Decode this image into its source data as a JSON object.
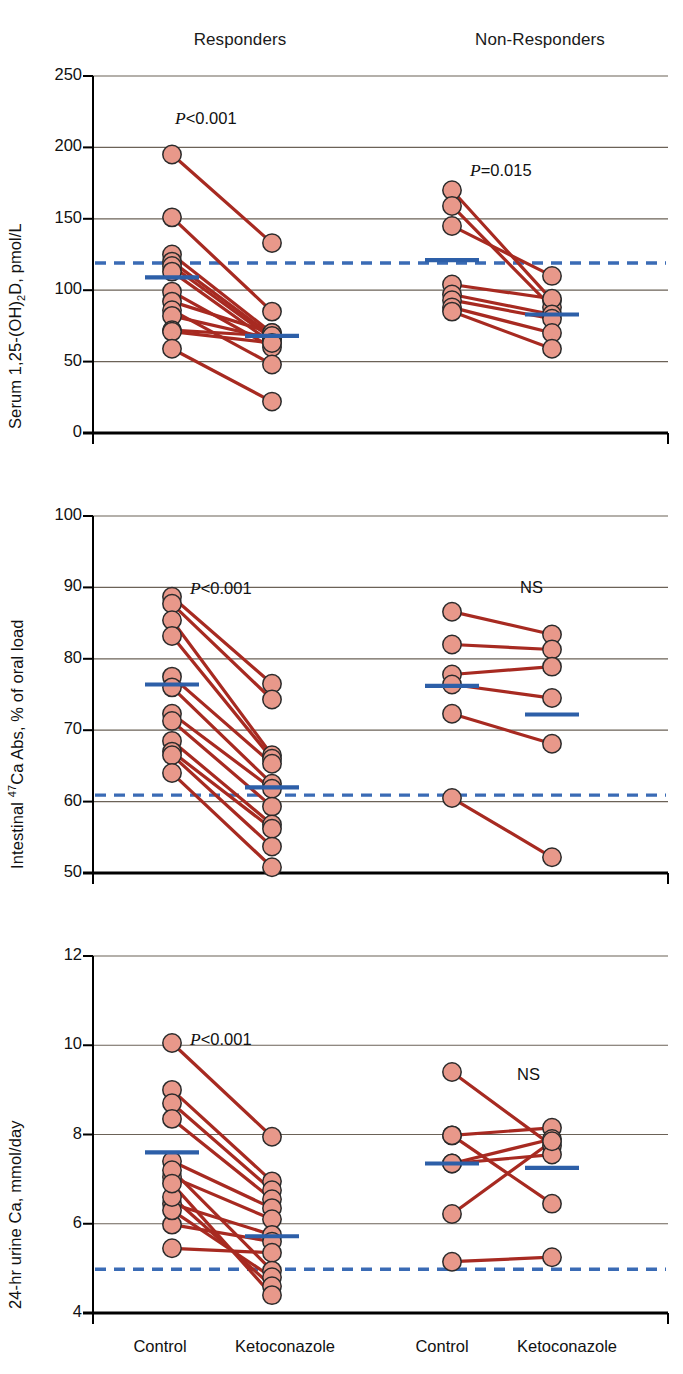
{
  "figure": {
    "groups": [
      {
        "key": "responders",
        "label": "Responders"
      },
      {
        "key": "nonresponders",
        "label": "Non-Responders"
      }
    ],
    "x_categories": [
      "Control",
      "Ketoconazole"
    ],
    "colors": {
      "marker_fill": "#E8988A",
      "marker_stroke": "#2b2b2b",
      "line": "#A72A21",
      "mean_bar": "#2D5FA8",
      "reference_dashed": "#3A6BB5",
      "axis": "#000000",
      "gridline": "#6b6257",
      "text": "#111111"
    }
  },
  "chart_data": [
    {
      "type": "line",
      "panel": 1,
      "title": "",
      "ylabel": "Serum 1,25-(OH)2D, pmol/L",
      "ylabel_parts": {
        "pre": "Serum 1,25-(OH)",
        "sub": "2",
        "post": "D, pmol/L"
      },
      "xlabel": "",
      "ylim": [
        0,
        250
      ],
      "yticks": [
        0,
        50,
        100,
        150,
        200,
        250
      ],
      "ytick_labels": [
        "0",
        "50",
        "100",
        "150",
        "200",
        "250"
      ],
      "grid": true,
      "groups": [
        {
          "name": "Responders",
          "annotation": "P<0.001",
          "annotation_html": "<i>P</i><0.001",
          "x": [
            "Control",
            "Ketoconazole"
          ],
          "pairs": [
            [
              195,
              133
            ],
            [
              151,
              85
            ],
            [
              125,
              70
            ],
            [
              120,
              68
            ],
            [
              117,
              66
            ],
            [
              113,
              63
            ],
            [
              99,
              60
            ],
            [
              92,
              70
            ],
            [
              86,
              48
            ],
            [
              82,
              66
            ],
            [
              72,
              68
            ],
            [
              71,
              63
            ],
            [
              59,
              22
            ]
          ],
          "mean_control": 109,
          "mean_treated": 68
        },
        {
          "name": "Non-Responders",
          "annotation": "P=0.015",
          "annotation_html": "<i>P</i>=0.015",
          "x": [
            "Control",
            "Ketoconazole"
          ],
          "pairs": [
            [
              170,
              93
            ],
            [
              159,
              88
            ],
            [
              145,
              110
            ],
            [
              104,
              94
            ],
            [
              97,
              83
            ],
            [
              93,
              80
            ],
            [
              88,
              70
            ],
            [
              85,
              59
            ]
          ],
          "mean_control": 121,
          "mean_treated": 83
        }
      ],
      "reference_line": {
        "value": 119,
        "style": "dashed",
        "spans": "full-width"
      }
    },
    {
      "type": "line",
      "panel": 2,
      "title": "",
      "ylabel": "Intestinal 47Ca Abs, % of oral load",
      "ylabel_parts": {
        "pre": "Intestinal ",
        "sup": "47",
        "post": "Ca Abs, % of oral load"
      },
      "xlabel": "",
      "ylim": [
        50,
        100
      ],
      "yticks": [
        50,
        60,
        70,
        80,
        90,
        100
      ],
      "ytick_labels": [
        "50",
        "60",
        "70",
        "80",
        "90",
        "100"
      ],
      "grid": true,
      "groups": [
        {
          "name": "Responders",
          "annotation": "P<0.001",
          "annotation_html": "<i>P</i><0.001",
          "x": [
            "Control",
            "Ketoconazole"
          ],
          "pairs": [
            [
              88.7,
              76.5
            ],
            [
              87.7,
              74.3
            ],
            [
              85.4,
              66.5
            ],
            [
              83.2,
              66.0
            ],
            [
              77.5,
              65.3
            ],
            [
              76.0,
              62.5
            ],
            [
              72.3,
              61.8
            ],
            [
              71.3,
              59.3
            ],
            [
              68.5,
              56.8
            ],
            [
              67.0,
              56.2
            ],
            [
              66.5,
              53.7
            ],
            [
              64.0,
              50.8
            ]
          ],
          "mean_control": 76.4,
          "mean_treated": 62.0
        },
        {
          "name": "Non-Responders",
          "annotation": "NS",
          "annotation_html": "NS",
          "x": [
            "Control",
            "Ketoconazole"
          ],
          "pairs": [
            [
              86.6,
              83.4
            ],
            [
              82.0,
              81.3
            ],
            [
              77.8,
              78.9
            ],
            [
              76.4,
              74.5
            ],
            [
              72.3,
              68.1
            ],
            [
              60.5,
              52.2
            ]
          ],
          "mean_control": 76.2,
          "mean_treated": 72.2
        }
      ],
      "reference_line": {
        "value": 60.9,
        "style": "dashed",
        "spans": "full-width"
      }
    },
    {
      "type": "line",
      "panel": 3,
      "title": "",
      "ylabel": "24-hr urine Ca, mmol/day",
      "ylabel_parts": {
        "pre": "24-hr urine Ca, mmol/day"
      },
      "xlabel": "",
      "ylim": [
        4,
        12
      ],
      "yticks": [
        4,
        6,
        8,
        10,
        12
      ],
      "ytick_labels": [
        "4",
        "6",
        "8",
        "10",
        "12"
      ],
      "grid": true,
      "groups": [
        {
          "name": "Responders",
          "annotation": "P<0.001",
          "annotation_html": "<i>P</i><0.001",
          "x": [
            "Control",
            "Ketoconazole"
          ],
          "pairs": [
            [
              10.05,
              7.95
            ],
            [
              9.0,
              6.95
            ],
            [
              8.7,
              6.75
            ],
            [
              8.35,
              6.55
            ],
            [
              7.4,
              6.35
            ],
            [
              7.05,
              6.1
            ],
            [
              6.45,
              5.75
            ],
            [
              5.98,
              5.6
            ],
            [
              5.45,
              5.35
            ],
            [
              7.2,
              4.95
            ],
            [
              6.3,
              4.8
            ],
            [
              6.6,
              4.6
            ],
            [
              6.9,
              4.4
            ]
          ],
          "mean_control": 7.6,
          "mean_treated": 5.72
        },
        {
          "name": "Non-Responders",
          "annotation": "NS",
          "annotation_html": "NS",
          "x": [
            "Control",
            "Ketoconazole"
          ],
          "pairs": [
            [
              9.4,
              7.75
            ],
            [
              7.98,
              8.15
            ],
            [
              7.98,
              6.45
            ],
            [
              7.35,
              7.9
            ],
            [
              7.35,
              7.55
            ],
            [
              6.22,
              7.85
            ],
            [
              5.15,
              5.25
            ]
          ],
          "mean_control": 7.35,
          "mean_treated": 7.25
        }
      ],
      "reference_line": {
        "value": 4.98,
        "style": "dashed",
        "spans": "full-width"
      }
    }
  ]
}
